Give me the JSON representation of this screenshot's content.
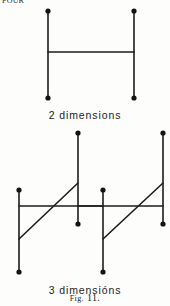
{
  "page": {
    "background_color": "#fdfdfc",
    "ink_color": "#1c1c1c",
    "edge_text": "FOUR"
  },
  "figure": {
    "number_prefix": "Fig.",
    "number": "11.",
    "number_full": "Fig. 11.",
    "panels": [
      {
        "id": "two-dimensions",
        "caption": "2 dimensions",
        "caption_y": 105
      },
      {
        "id": "three-dimensions",
        "caption": "3 dimensións",
        "caption_y": 280
      }
    ]
  },
  "chart_data": {
    "type": "diagram",
    "title": "Fig. 11.",
    "stroke_color": "#1c1c1c",
    "node_color": "#141414",
    "stroke_width": 1.6,
    "node_radius": 2.6,
    "panels": [
      {
        "id": "two-dimensions",
        "label": "2 dimensions",
        "edges": [
          {
            "name": "left-post",
            "x1": 48,
            "y1": 11,
            "x2": 48,
            "y2": 98
          },
          {
            "name": "right-post",
            "x1": 134,
            "y1": 11,
            "x2": 134,
            "y2": 98
          },
          {
            "name": "crossbar",
            "x1": 48,
            "y1": 52,
            "x2": 134,
            "y2": 52
          }
        ],
        "nodes": [
          {
            "name": "left-top",
            "x": 48,
            "y": 11
          },
          {
            "name": "right-top",
            "x": 134,
            "y": 11
          },
          {
            "name": "left-bottom",
            "x": 48,
            "y": 98
          },
          {
            "name": "right-bottom",
            "x": 134,
            "y": 98
          }
        ]
      },
      {
        "id": "three-dimensions",
        "label": "3 dimensións",
        "edges": [
          {
            "name": "front-left-post",
            "x1": 19,
            "y1": 190,
            "x2": 19,
            "y2": 272
          },
          {
            "name": "front-right-post",
            "x1": 103,
            "y1": 190,
            "x2": 103,
            "y2": 272
          },
          {
            "name": "front-crossbar",
            "x1": 19,
            "y1": 206,
            "x2": 103,
            "y2": 206
          },
          {
            "name": "back-left-post",
            "x1": 78,
            "y1": 133,
            "x2": 78,
            "y2": 224
          },
          {
            "name": "back-right-post",
            "x1": 163,
            "y1": 133,
            "x2": 163,
            "y2": 224
          },
          {
            "name": "back-crossbar",
            "x1": 78,
            "y1": 206,
            "x2": 163,
            "y2": 206
          },
          {
            "name": "left-diagonal",
            "x1": 19,
            "y1": 239,
            "x2": 78,
            "y2": 183
          },
          {
            "name": "right-diagonal",
            "x1": 103,
            "y1": 239,
            "x2": 163,
            "y2": 183
          }
        ],
        "nodes": [
          {
            "name": "front-left-top",
            "x": 19,
            "y": 190
          },
          {
            "name": "front-right-top",
            "x": 103,
            "y": 190
          },
          {
            "name": "front-left-bottom",
            "x": 19,
            "y": 272
          },
          {
            "name": "front-right-bottom",
            "x": 103,
            "y": 272
          },
          {
            "name": "back-left-top",
            "x": 78,
            "y": 133
          },
          {
            "name": "back-right-top",
            "x": 163,
            "y": 133
          },
          {
            "name": "back-left-bottom",
            "x": 78,
            "y": 224
          },
          {
            "name": "back-right-bottom",
            "x": 163,
            "y": 224
          }
        ]
      }
    ]
  }
}
